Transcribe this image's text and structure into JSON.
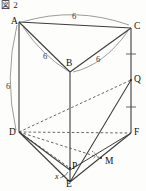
{
  "figure": {
    "caption": "図 2"
  },
  "vertices": [
    {
      "name": "A",
      "label": "A",
      "x": 19,
      "y": 22
    },
    {
      "name": "B",
      "label": "B",
      "x": 70,
      "y": 72
    },
    {
      "name": "C",
      "label": "C",
      "x": 131,
      "y": 28
    },
    {
      "name": "D",
      "label": "D",
      "x": 19,
      "y": 132
    },
    {
      "name": "E",
      "label": "E",
      "x": 70,
      "y": 182
    },
    {
      "name": "F",
      "label": "F",
      "x": 131,
      "y": 133
    },
    {
      "name": "P",
      "label": "P",
      "x": 70,
      "y": 168
    },
    {
      "name": "Q",
      "label": "Q",
      "x": 131,
      "y": 80
    },
    {
      "name": "M",
      "label": "M",
      "x": 101,
      "y": 158
    }
  ],
  "vertex_labels": [
    {
      "name": "label-A",
      "text": "A",
      "left": 11,
      "top": 17
    },
    {
      "name": "label-B",
      "text": "B",
      "left": 66,
      "top": 59
    },
    {
      "name": "label-C",
      "text": "C",
      "left": 134,
      "top": 22
    },
    {
      "name": "label-D",
      "text": "D",
      "left": 9,
      "top": 128
    },
    {
      "name": "label-E",
      "text": "E",
      "left": 66,
      "top": 180
    },
    {
      "name": "label-F",
      "text": "F",
      "left": 134,
      "top": 128
    },
    {
      "name": "label-P",
      "text": "P",
      "left": 72,
      "top": 162
    },
    {
      "name": "label-Q",
      "text": "Q",
      "left": 134,
      "top": 75
    },
    {
      "name": "label-M",
      "text": "M",
      "left": 105,
      "top": 157
    }
  ],
  "measure_labels": [
    {
      "name": "length-AC",
      "text": "6",
      "left": 72,
      "top": 12
    },
    {
      "name": "length-AB",
      "text": "6",
      "left": 43,
      "top": 52
    },
    {
      "name": "length-BC",
      "text": "6",
      "left": 96,
      "top": 55
    },
    {
      "name": "length-AD",
      "text": "6",
      "left": 6,
      "top": 82
    }
  ],
  "angle_labels": [
    {
      "name": "angle-x-at-E",
      "text": "x",
      "left": 55,
      "top": 173
    }
  ],
  "colors": {
    "stroke": "#3c3c3c",
    "arc": "#8a8a8a",
    "dashed": "#555555",
    "text": "#111111",
    "background": "#fdfdfc"
  },
  "annotations": {
    "tick_marks_on": "CQ and QF equal segments",
    "right_angle_at": "M",
    "angle_marker_at": "E"
  }
}
